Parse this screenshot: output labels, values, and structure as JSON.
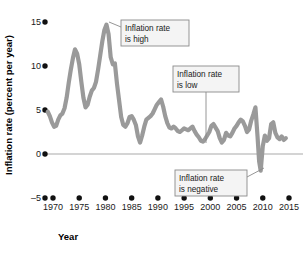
{
  "chart_data": {
    "type": "line",
    "title": "",
    "xlabel": "Year",
    "ylabel": "Inflation rate (percent per year)",
    "xlim": [
      1968,
      2016
    ],
    "ylim": [
      -5,
      15
    ],
    "xticks": [
      1970,
      1975,
      1980,
      1985,
      1990,
      1995,
      2000,
      2005,
      2010,
      2015
    ],
    "xtick_labels": [
      "1970",
      "1975",
      "1980",
      "1985",
      "1990",
      "1995",
      "2000",
      "2005",
      "2010",
      "2015"
    ],
    "yticks": [
      -5,
      0,
      5,
      10,
      15
    ],
    "ytick_labels": [
      "–5",
      "0",
      "5",
      "10",
      "15"
    ],
    "grid": false,
    "legend": "none",
    "zero_line": 0,
    "line_color": "#9a9a9a",
    "line_width": 4.2,
    "series": [
      {
        "name": "Inflation rate",
        "x": [
          1969.0,
          1969.4,
          1969.8,
          1970.2,
          1970.6,
          1971.0,
          1971.4,
          1971.8,
          1972.2,
          1972.6,
          1973.0,
          1973.4,
          1973.8,
          1974.2,
          1974.6,
          1975.0,
          1975.4,
          1975.8,
          1976.2,
          1976.6,
          1977.0,
          1977.4,
          1977.8,
          1978.2,
          1978.6,
          1979.0,
          1979.4,
          1979.8,
          1980.2,
          1980.6,
          1981.0,
          1981.4,
          1981.8,
          1982.2,
          1982.6,
          1983.0,
          1983.4,
          1983.8,
          1984.2,
          1984.6,
          1985.0,
          1985.4,
          1985.8,
          1986.2,
          1986.6,
          1987.0,
          1987.4,
          1987.8,
          1988.2,
          1988.6,
          1989.0,
          1989.4,
          1989.8,
          1990.2,
          1990.6,
          1991.0,
          1991.4,
          1991.8,
          1992.2,
          1992.6,
          1993.0,
          1993.4,
          1993.8,
          1994.2,
          1994.6,
          1995.0,
          1995.4,
          1995.8,
          1996.2,
          1996.6,
          1997.0,
          1997.4,
          1997.8,
          1998.2,
          1998.6,
          1999.0,
          1999.4,
          1999.8,
          2000.2,
          2000.6,
          2001.0,
          2001.4,
          2001.8,
          2002.2,
          2002.6,
          2003.0,
          2003.4,
          2003.8,
          2004.2,
          2004.6,
          2005.0,
          2005.4,
          2005.8,
          2006.2,
          2006.6,
          2007.0,
          2007.4,
          2007.8,
          2008.2,
          2008.6,
          2009.0,
          2009.3,
          2009.6,
          2010.0,
          2010.4,
          2010.8,
          2011.2,
          2011.6,
          2012.0,
          2012.4,
          2012.8,
          2013.2,
          2013.6,
          2014.0,
          2014.4
        ],
        "y": [
          4.8,
          4.3,
          3.6,
          3.1,
          3.2,
          3.9,
          4.4,
          4.6,
          5.2,
          6.4,
          8.1,
          9.6,
          10.9,
          11.9,
          11.4,
          10.2,
          8.2,
          6.4,
          5.3,
          5.6,
          6.5,
          7.2,
          7.5,
          8.2,
          9.6,
          11.2,
          12.8,
          14.1,
          14.7,
          13.6,
          11.0,
          10.2,
          10.3,
          8.0,
          6.1,
          4.2,
          3.3,
          3.1,
          3.5,
          4.2,
          4.3,
          3.9,
          3.3,
          2.0,
          1.3,
          2.1,
          3.1,
          3.9,
          4.1,
          4.3,
          4.6,
          5.1,
          5.6,
          5.9,
          6.2,
          5.4,
          4.3,
          3.5,
          3.0,
          2.9,
          3.1,
          2.9,
          2.6,
          2.5,
          2.7,
          2.9,
          2.8,
          2.7,
          2.9,
          3.1,
          2.6,
          2.2,
          1.9,
          1.5,
          1.4,
          1.7,
          2.1,
          2.5,
          3.2,
          3.4,
          3.0,
          2.6,
          1.8,
          1.3,
          1.6,
          2.4,
          2.1,
          2.0,
          2.4,
          2.9,
          3.2,
          3.6,
          3.9,
          3.7,
          3.2,
          2.5,
          2.8,
          3.8,
          4.5,
          5.3,
          2.0,
          -0.8,
          -1.9,
          0.9,
          2.1,
          1.5,
          1.8,
          3.4,
          3.6,
          2.4,
          1.9,
          1.7,
          2.0,
          1.6,
          1.8
        ]
      }
    ],
    "annotations": [
      {
        "id": "inflation-high",
        "lines": [
          "Inflation rate",
          "is high"
        ],
        "box": {
          "x": 121,
          "y": 20,
          "w": 68,
          "h": 26
        },
        "leader": [
          [
            121,
            27
          ],
          [
            109,
            22
          ]
        ]
      },
      {
        "id": "inflation-low",
        "lines": [
          "Inflation rate",
          "is low"
        ],
        "box": {
          "x": 173,
          "y": 66,
          "w": 66,
          "h": 26
        },
        "leader": [
          [
            206,
            92
          ],
          [
            206,
            143
          ]
        ]
      },
      {
        "id": "inflation-negative",
        "lines": [
          "Inflation rate",
          "is negative"
        ],
        "box": {
          "x": 175,
          "y": 170,
          "w": 72,
          "h": 26
        },
        "leader": [
          [
            247,
            177
          ],
          [
            264,
            168
          ]
        ]
      }
    ]
  }
}
